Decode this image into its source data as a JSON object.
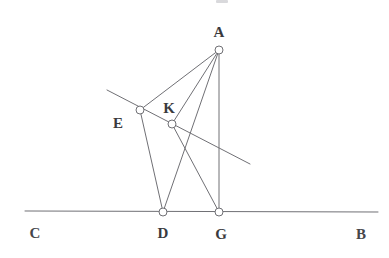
{
  "figure": {
    "background_color": "#ffffff",
    "stroke_color": "#707075",
    "label_color": "#3a3a3e",
    "stroke_width": 1,
    "width": 389,
    "height": 258
  },
  "points": [
    {
      "id": "A",
      "label": "A",
      "x": 219,
      "y": 50,
      "label_x": 219,
      "label_y": 32,
      "marker": "open-circle",
      "radius": 4
    },
    {
      "id": "E",
      "label": "E",
      "x": 140,
      "y": 110,
      "label_x": 118,
      "label_y": 123,
      "marker": "open-circle",
      "radius": 4
    },
    {
      "id": "K",
      "label": "K",
      "x": 172,
      "y": 124,
      "label_x": 169,
      "label_y": 108,
      "marker": "open-circle",
      "radius": 4
    },
    {
      "id": "D",
      "label": "D",
      "x": 163,
      "y": 212,
      "label_x": 163,
      "label_y": 233,
      "marker": "open-circle",
      "radius": 4
    },
    {
      "id": "G",
      "label": "G",
      "x": 219,
      "y": 212,
      "label_x": 221,
      "label_y": 234,
      "marker": "open-circle",
      "radius": 4
    }
  ],
  "ray_endpoints": [
    {
      "id": "C",
      "label": "C",
      "x": 25,
      "y": 211,
      "label_x": 35,
      "label_y": 233
    },
    {
      "id": "B",
      "label": "B",
      "x": 378,
      "y": 212,
      "label_x": 361,
      "label_y": 234
    }
  ],
  "segments": [
    {
      "id": "CB",
      "name": "baseline-CB",
      "x1": 25,
      "y1": 211,
      "x2": 378,
      "y2": 212
    },
    {
      "id": "oblique",
      "name": "oblique-line-through-E-K",
      "x1": 107,
      "y1": 90,
      "x2": 250,
      "y2": 164
    },
    {
      "id": "AE",
      "name": "segment-A-E",
      "x1": 219,
      "y1": 50,
      "x2": 140,
      "y2": 110
    },
    {
      "id": "AK",
      "name": "segment-A-K",
      "x1": 219,
      "y1": 50,
      "x2": 172,
      "y2": 124
    },
    {
      "id": "AD",
      "name": "segment-A-D",
      "x1": 219,
      "y1": 50,
      "x2": 163,
      "y2": 212
    },
    {
      "id": "AG",
      "name": "segment-A-G",
      "x1": 219,
      "y1": 50,
      "x2": 219,
      "y2": 212
    },
    {
      "id": "ED",
      "name": "segment-E-D",
      "x1": 140,
      "y1": 110,
      "x2": 163,
      "y2": 212
    },
    {
      "id": "KG",
      "name": "segment-K-G",
      "x1": 172,
      "y1": 124,
      "x2": 219,
      "y2": 212
    }
  ],
  "chart_data": {
    "type": "diagram",
    "vertices": {
      "A": [
        219,
        50
      ],
      "E": [
        140,
        110
      ],
      "K": [
        172,
        124
      ],
      "D": [
        163,
        212
      ],
      "G": [
        219,
        212
      ],
      "C": [
        25,
        211
      ],
      "B": [
        378,
        212
      ]
    },
    "edges": [
      [
        "C",
        "B"
      ],
      [
        "A",
        "E"
      ],
      [
        "A",
        "K"
      ],
      [
        "A",
        "D"
      ],
      [
        "A",
        "G"
      ],
      [
        "E",
        "D"
      ],
      [
        "K",
        "G"
      ]
    ],
    "auxiliary_lines": [
      {
        "name": "oblique line through E and K",
        "from": [
          107,
          90
        ],
        "to": [
          250,
          164
        ]
      }
    ],
    "labels": [
      "A",
      "E",
      "K",
      "C",
      "D",
      "G",
      "B"
    ]
  }
}
